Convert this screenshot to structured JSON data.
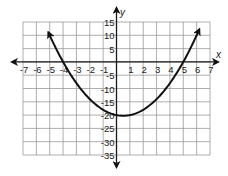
{
  "chart_data": {
    "type": "line",
    "title": "",
    "xlabel": "x",
    "ylabel": "y",
    "xlim": [
      -7,
      7
    ],
    "ylim": [
      -35,
      15
    ],
    "x_ticks": [
      -7,
      -6,
      -5,
      -4,
      -3,
      -2,
      -1,
      1,
      2,
      3,
      4,
      5,
      6,
      7
    ],
    "y_ticks": [
      15,
      10,
      5,
      -5,
      -10,
      -15,
      -20,
      -25,
      -30,
      -35
    ],
    "x_tick_labels": [
      "-7",
      "-6",
      "-5",
      "-4",
      "-3",
      "-2",
      "-1",
      "1",
      "2",
      "3",
      "4",
      "5",
      "6",
      "7"
    ],
    "y_tick_labels": [
      "15",
      "10",
      "5",
      "-5",
      "-10",
      "-15",
      "-20",
      "-25",
      "-30",
      "-35"
    ],
    "grid": true,
    "legend": null,
    "series": [
      {
        "name": "parabola",
        "equation": "y = x^2 - x - 20",
        "roots": [
          -4,
          5
        ],
        "y_intercept": -20,
        "vertex": [
          0.5,
          -20.25
        ],
        "arrows_on_ends": true,
        "x": [
          -5.1,
          -5,
          -4,
          -3,
          -2,
          -1,
          0,
          0.5,
          1,
          2,
          3,
          4,
          5,
          6,
          6.2
        ],
        "values": [
          11.1,
          10,
          0,
          -8,
          -14,
          -18,
          -20,
          -20.25,
          -20,
          -18,
          -14,
          -8,
          0,
          10,
          12.2
        ]
      }
    ]
  },
  "colors": {
    "grid": "#9a9a9a",
    "axes": "#1a1a1a",
    "curve": "#111111",
    "background": "#ffffff"
  }
}
